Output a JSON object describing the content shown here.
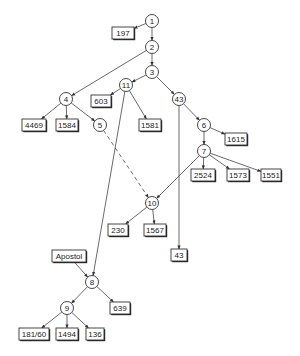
{
  "diagram": {
    "type": "directed-tree",
    "circle_nodes": [
      {
        "id": "1",
        "label": "1",
        "x": 152,
        "y": 21
      },
      {
        "id": "2",
        "label": "2",
        "x": 152,
        "y": 47
      },
      {
        "id": "3",
        "label": "3",
        "x": 152,
        "y": 72
      },
      {
        "id": "11",
        "label": "11",
        "x": 126,
        "y": 85
      },
      {
        "id": "43",
        "label": "43",
        "x": 179,
        "y": 99
      },
      {
        "id": "4",
        "label": "4",
        "x": 66,
        "y": 99
      },
      {
        "id": "5",
        "label": "5",
        "x": 100,
        "y": 125
      },
      {
        "id": "6",
        "label": "6",
        "x": 204,
        "y": 125
      },
      {
        "id": "7",
        "label": "7",
        "x": 204,
        "y": 151
      },
      {
        "id": "10",
        "label": "10",
        "x": 152,
        "y": 203
      },
      {
        "id": "8",
        "label": "8",
        "x": 92,
        "y": 282
      },
      {
        "id": "9",
        "label": "9",
        "x": 67,
        "y": 308
      }
    ],
    "box_nodes": [
      {
        "id": "b197",
        "label": "197",
        "x": 123,
        "y": 33,
        "w": 22
      },
      {
        "id": "b603",
        "label": "603",
        "x": 101,
        "y": 101,
        "w": 20
      },
      {
        "id": "b4469",
        "label": "4469",
        "x": 34,
        "y": 125,
        "w": 24
      },
      {
        "id": "b1584",
        "label": "1584",
        "x": 67,
        "y": 125,
        "w": 22
      },
      {
        "id": "b1581",
        "label": "1581",
        "x": 150,
        "y": 125,
        "w": 22
      },
      {
        "id": "b1615",
        "label": "1615",
        "x": 236,
        "y": 139,
        "w": 22
      },
      {
        "id": "b2524",
        "label": "2524",
        "x": 203,
        "y": 175,
        "w": 24
      },
      {
        "id": "b1573",
        "label": "1573",
        "x": 238,
        "y": 175,
        "w": 22
      },
      {
        "id": "b1551",
        "label": "1551",
        "x": 271,
        "y": 175,
        "w": 20
      },
      {
        "id": "b230",
        "label": "230",
        "x": 118,
        "y": 230,
        "w": 20
      },
      {
        "id": "b1567",
        "label": "1567",
        "x": 155,
        "y": 230,
        "w": 22
      },
      {
        "id": "b43",
        "label": "43",
        "x": 179,
        "y": 255,
        "w": 16
      },
      {
        "id": "bApostol",
        "label": "Apostol",
        "x": 69,
        "y": 256,
        "w": 34
      },
      {
        "id": "b639",
        "label": "639",
        "x": 120,
        "y": 308,
        "w": 20
      },
      {
        "id": "b18160",
        "label": "181/60",
        "x": 34,
        "y": 334,
        "w": 30
      },
      {
        "id": "b1494",
        "label": "1494",
        "x": 67,
        "y": 334,
        "w": 22
      },
      {
        "id": "b136",
        "label": "136",
        "x": 95,
        "y": 334,
        "w": 18
      }
    ],
    "edges": [
      {
        "from": "1",
        "to": "b197",
        "style": "solid"
      },
      {
        "from": "1",
        "to": "2",
        "style": "solid"
      },
      {
        "from": "2",
        "to": "3",
        "style": "solid"
      },
      {
        "from": "2",
        "to": "4",
        "style": "solid"
      },
      {
        "from": "3",
        "to": "11",
        "style": "solid"
      },
      {
        "from": "3",
        "to": "43",
        "style": "solid"
      },
      {
        "from": "11",
        "to": "b603",
        "style": "solid"
      },
      {
        "from": "11",
        "to": "b1581",
        "style": "solid"
      },
      {
        "from": "11",
        "to": "8",
        "style": "solid"
      },
      {
        "from": "4",
        "to": "b4469",
        "style": "solid"
      },
      {
        "from": "4",
        "to": "b1584",
        "style": "solid"
      },
      {
        "from": "4",
        "to": "5",
        "style": "solid"
      },
      {
        "from": "5",
        "to": "10",
        "style": "dashed"
      },
      {
        "from": "43",
        "to": "6",
        "style": "solid"
      },
      {
        "from": "43",
        "to": "b43",
        "style": "solid"
      },
      {
        "from": "6",
        "to": "b1615",
        "style": "solid"
      },
      {
        "from": "6",
        "to": "7",
        "style": "solid"
      },
      {
        "from": "7",
        "to": "b2524",
        "style": "solid"
      },
      {
        "from": "7",
        "to": "b1573",
        "style": "solid"
      },
      {
        "from": "7",
        "to": "b1551",
        "style": "solid"
      },
      {
        "from": "7",
        "to": "10",
        "style": "solid"
      },
      {
        "from": "10",
        "to": "b230",
        "style": "solid"
      },
      {
        "from": "10",
        "to": "b1567",
        "style": "solid"
      },
      {
        "from": "bApostol",
        "to": "8",
        "style": "solid"
      },
      {
        "from": "8",
        "to": "b639",
        "style": "solid"
      },
      {
        "from": "8",
        "to": "9",
        "style": "solid"
      },
      {
        "from": "9",
        "to": "b18160",
        "style": "solid"
      },
      {
        "from": "9",
        "to": "b1494",
        "style": "solid"
      },
      {
        "from": "9",
        "to": "b136",
        "style": "solid"
      }
    ]
  }
}
